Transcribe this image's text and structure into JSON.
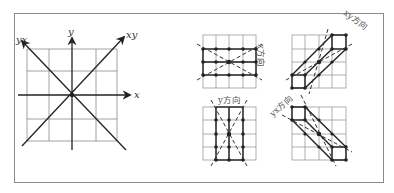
{
  "figure": {
    "axes_diagram": {
      "labels": {
        "x": "x",
        "y": "y",
        "xy": "xy",
        "yx": "yx"
      },
      "grid": {
        "cols": 4,
        "rows": 4
      },
      "directions": [
        "x",
        "y",
        "xy",
        "yx"
      ]
    },
    "panels": [
      {
        "id": "x-direction",
        "label": "x方向",
        "grid": {
          "cols": 4,
          "rows": 4
        }
      },
      {
        "id": "y-direction",
        "label": "y方向",
        "grid": {
          "cols": 4,
          "rows": 4
        }
      },
      {
        "id": "xy-direction",
        "label": "xy方向",
        "grid": {
          "cols": 4,
          "rows": 4
        }
      },
      {
        "id": "yx-direction",
        "label": "yx方向",
        "grid": {
          "cols": 4,
          "rows": 4
        }
      }
    ],
    "colors": {
      "grid": "#8c8c8c",
      "lines": "#222222",
      "dashed": "#333333",
      "frame": "#8a8a8a",
      "label": "#555555"
    }
  }
}
